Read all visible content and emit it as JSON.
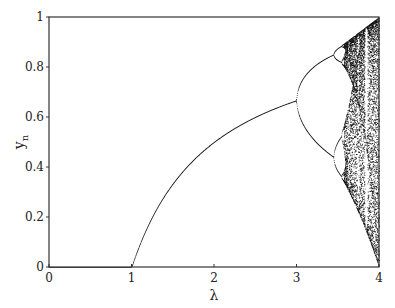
{
  "chart_data": {
    "type": "scatter",
    "title": "",
    "subtitle": "",
    "xlabel": "λ",
    "ylabel": "y",
    "ylabel_subscript": "n",
    "xlim": [
      0,
      4
    ],
    "ylim": [
      0,
      1
    ],
    "x_ticks": [
      0,
      1,
      2,
      3,
      4
    ],
    "x_tick_labels": [
      "0",
      "1",
      "2",
      "3",
      "4"
    ],
    "y_ticks": [
      0,
      0.2,
      0.4,
      0.6,
      0.8,
      1
    ],
    "y_tick_labels": [
      "0",
      "0.2",
      "0.4",
      "0.6",
      "0.8",
      "1"
    ],
    "grid": false,
    "legend": null,
    "map": "logistic",
    "key_points": [
      {
        "lambda": 0,
        "y": 0
      },
      {
        "lambda": 1,
        "y": 0
      },
      {
        "lambda": 2,
        "y": 0.5
      },
      {
        "lambda": 3,
        "y": 0.667
      },
      {
        "lambda": 3.45,
        "y_branches": [
          0.44,
          0.85
        ]
      },
      {
        "lambda": 3.57,
        "note": "onset of chaos"
      },
      {
        "lambda": 4,
        "y_range": [
          0,
          1
        ]
      }
    ],
    "stable_branch_formula": "y = 1 - 1/λ for 1 < λ < 3; y = 0 for λ < 1",
    "sampling": {
      "lambda_step": 0.004,
      "transient_iterations": 300,
      "plotted_iterations": 60,
      "initial_y": 0.3
    },
    "marker_color": "#111111",
    "axis_color": "#333333"
  }
}
